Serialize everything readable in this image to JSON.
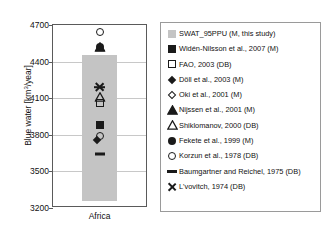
{
  "chart_data": {
    "type": "scatter",
    "title": "",
    "xlabel": "",
    "ylabel": "Blue water [km3/year]",
    "ylabel_base": "Blue water [km",
    "ylabel_sup": "3",
    "ylabel_tail": "/year]",
    "categories": [
      "Africa"
    ],
    "ylim": [
      3200,
      4700
    ],
    "yticks": [
      4700,
      4400,
      4100,
      3800,
      3500,
      3200
    ],
    "grid": true,
    "legend_position": "right",
    "bar": {
      "name": "SWAT_95PPU (M, this study)",
      "category": "Africa",
      "low": 3260,
      "high": 4455,
      "color": "#c4c4c4"
    },
    "points": [
      {
        "label": "L'vovitch, 1974 (DB)",
        "marker": "x",
        "value": 4190
      },
      {
        "label": "Widén-Nilsson et al., 2007 (M)",
        "marker": "square-fill",
        "value": 3880
      },
      {
        "label": "FAO, 2003 (DB)",
        "marker": "square-open",
        "value": 4060
      },
      {
        "label": "Döll et al., 2003 (M)",
        "marker": "diamond-fill",
        "value": 3730
      },
      {
        "label": "Oki et al., 2001 (M)",
        "marker": "circle-open",
        "value": 3790
      },
      {
        "label": "Nijssen et al., 2001 (M)",
        "marker": "tri-fill",
        "value": 4520
      },
      {
        "label": "Shiklomanov, 2000 (DB)",
        "marker": "tri-open",
        "value": 4110
      },
      {
        "label": "Fekete et al., 1999 (M)",
        "marker": "circle-fill",
        "value": 4520
      },
      {
        "label": "Korzun et al., 1978 (DB)",
        "marker": "circle-open2",
        "value": 4640
      },
      {
        "label": "Baumgartner and Reichel, 1975 (DB)",
        "marker": "dash",
        "value": 3640
      }
    ]
  },
  "legend": {
    "items": [
      {
        "marker": "square-gray",
        "label": "SWAT_95PPU (M, this study)"
      },
      {
        "marker": "square-fill",
        "label": "Widén-Nilsson et al., 2007 (M)"
      },
      {
        "marker": "square-open",
        "label": "FAO, 2003 (DB)"
      },
      {
        "marker": "diamond-fill",
        "label": "Döll et al., 2003 (M)"
      },
      {
        "marker": "diamond-open",
        "label": "Oki et al., 2001 (M)"
      },
      {
        "marker": "tri-fill",
        "label": "Nijssen et al., 2001 (M)"
      },
      {
        "marker": "tri-open",
        "label": "Shiklomanov, 2000 (DB)"
      },
      {
        "marker": "circle-fill",
        "label": "Fekete et al., 1999 (M)"
      },
      {
        "marker": "circle-open",
        "label": "Korzun et al., 1978 (DB)"
      },
      {
        "marker": "dash",
        "label": "Baumgartner and Reichel, 1975 (DB)"
      },
      {
        "marker": "x",
        "label": "L'vovitch, 1974 (DB)"
      }
    ]
  },
  "axis": {
    "x_category": "Africa",
    "y_ticks": [
      "4700",
      "4400",
      "4100",
      "3800",
      "3500",
      "3200"
    ]
  },
  "colors": {
    "bar_gray": "#c4c4c4",
    "marker_black": "#1a1a1a",
    "grid": "#c8c8c8",
    "frame": "#5a5a5a"
  }
}
